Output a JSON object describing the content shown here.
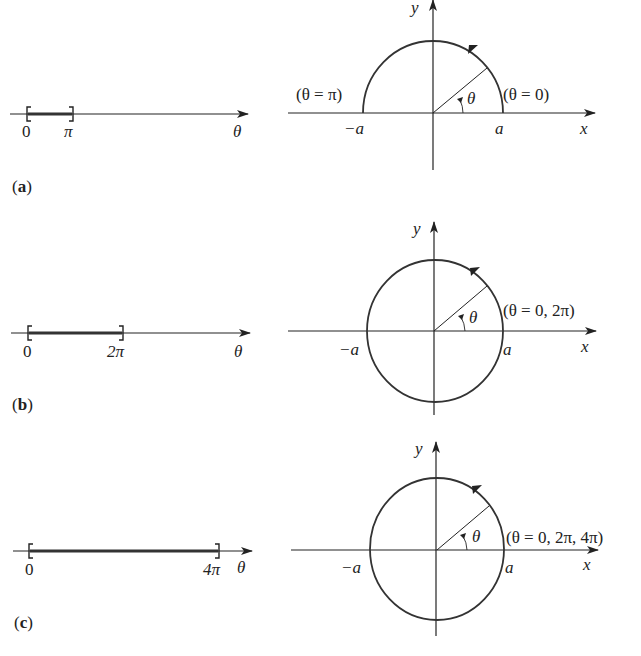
{
  "panels": [
    {
      "id": "a",
      "label_open": "(",
      "label_letter": "a",
      "label_close": ")",
      "number_line": {
        "start_label": "0",
        "end_label": "π",
        "axis_label": "θ",
        "interval": "[0, π]"
      },
      "plot": {
        "x_axis_label": "x",
        "y_axis_label": "y",
        "neg_a_label": "−a",
        "pos_a_label": "a",
        "angle_label": "θ",
        "start_annotation": "(θ = 0)",
        "end_annotation": "(θ = π)",
        "curve": "upper semicircle"
      }
    },
    {
      "id": "b",
      "label_open": "(",
      "label_letter": "b",
      "label_close": ")",
      "number_line": {
        "start_label": "0",
        "end_label": "2π",
        "axis_label": "θ",
        "interval": "[0, 2π]"
      },
      "plot": {
        "x_axis_label": "x",
        "y_axis_label": "y",
        "neg_a_label": "−a",
        "pos_a_label": "a",
        "angle_label": "θ",
        "start_annotation": "(θ = 0, 2π)",
        "curve": "full circle"
      }
    },
    {
      "id": "c",
      "label_open": "(",
      "label_letter": "c",
      "label_close": ")",
      "number_line": {
        "start_label": "0",
        "end_label": "4π",
        "axis_label": "θ",
        "interval": "[0, 4π]"
      },
      "plot": {
        "x_axis_label": "x",
        "y_axis_label": "y",
        "neg_a_label": "−a",
        "pos_a_label": "a",
        "angle_label": "θ",
        "start_annotation": "(θ = 0, 2π, 4π)",
        "curve": "full circle traced twice"
      }
    }
  ],
  "colors": {
    "ink": "#222222",
    "background": "#ffffff"
  }
}
